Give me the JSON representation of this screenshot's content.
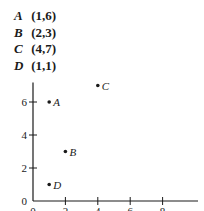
{
  "legend": [
    {
      "label": "A",
      "coords": "(1,6)"
    },
    {
      "label": "B",
      "coords": "(2,3)"
    },
    {
      "label": "C",
      "coords": "(4,7)"
    },
    {
      "label": "D",
      "coords": "(1,1)"
    }
  ],
  "chart_data": {
    "type": "scatter",
    "title": "",
    "xlabel": "",
    "ylabel": "",
    "points": [
      {
        "label": "A",
        "x": 1,
        "y": 6
      },
      {
        "label": "B",
        "x": 2,
        "y": 3
      },
      {
        "label": "C",
        "x": 4,
        "y": 7
      },
      {
        "label": "D",
        "x": 1,
        "y": 1
      }
    ],
    "x_ticks": [
      0,
      2,
      4,
      6,
      8
    ],
    "y_ticks": [
      0,
      2,
      4,
      6
    ],
    "xlim": [
      0,
      10
    ],
    "ylim": [
      0,
      7
    ],
    "grid": false,
    "legend_position": "top-left text list",
    "colors": {
      "ink": "#1a1a1a",
      "background": "#ffffff"
    }
  }
}
